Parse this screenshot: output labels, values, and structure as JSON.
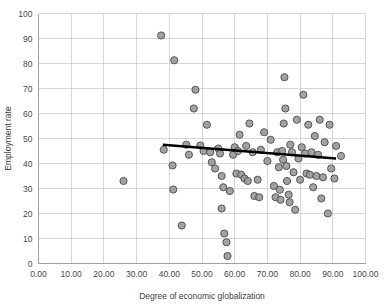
{
  "chart_data": {
    "type": "scatter",
    "title": "",
    "xlabel": "Degree of economic globalization",
    "ylabel": "Employment rate",
    "xlim": [
      0,
      100
    ],
    "ylim": [
      0,
      100
    ],
    "xticks": [
      "0.00",
      "10.00",
      "20.00",
      "30.00",
      "40.00",
      "50.00",
      "60.00",
      "70.00",
      "80.00",
      "90.00",
      "100.00"
    ],
    "xtick_values": [
      0,
      10,
      20,
      30,
      40,
      50,
      60,
      70,
      80,
      90,
      100
    ],
    "yticks": [
      "0",
      "10",
      "20",
      "30",
      "40",
      "50",
      "60",
      "70",
      "80",
      "90",
      "100"
    ],
    "ytick_values": [
      0,
      10,
      20,
      30,
      40,
      50,
      60,
      70,
      80,
      90,
      100
    ],
    "grid": true,
    "legend": false,
    "marker": {
      "shape": "circle",
      "fill_color": "#9a9a9a",
      "edge_color": "#4a4a4a",
      "radius_px": 3.6
    },
    "trendline": {
      "type": "linear",
      "color": "#000000",
      "x_start": 38.0,
      "y_start": 47.5,
      "x_end": 91.0,
      "y_end": 42.0,
      "slope": -0.1038,
      "intercept": 51.44
    },
    "points": [
      {
        "x": 26.0,
        "y": 33.0
      },
      {
        "x": 37.5,
        "y": 91.2
      },
      {
        "x": 38.3,
        "y": 45.5
      },
      {
        "x": 41.5,
        "y": 81.3
      },
      {
        "x": 41.0,
        "y": 39.2
      },
      {
        "x": 41.2,
        "y": 29.6
      },
      {
        "x": 43.8,
        "y": 15.2
      },
      {
        "x": 45.2,
        "y": 47.5
      },
      {
        "x": 46.0,
        "y": 43.5
      },
      {
        "x": 47.5,
        "y": 62.0
      },
      {
        "x": 48.0,
        "y": 69.5
      },
      {
        "x": 49.5,
        "y": 47.2
      },
      {
        "x": 50.5,
        "y": 45.0
      },
      {
        "x": 51.5,
        "y": 55.5
      },
      {
        "x": 52.5,
        "y": 44.5
      },
      {
        "x": 53.0,
        "y": 40.5
      },
      {
        "x": 54.0,
        "y": 38.0
      },
      {
        "x": 55.0,
        "y": 46.0
      },
      {
        "x": 55.5,
        "y": 44.0
      },
      {
        "x": 56.0,
        "y": 35.0
      },
      {
        "x": 56.5,
        "y": 30.5
      },
      {
        "x": 56.0,
        "y": 22.0
      },
      {
        "x": 56.8,
        "y": 12.0
      },
      {
        "x": 57.5,
        "y": 8.5
      },
      {
        "x": 57.8,
        "y": 3.0
      },
      {
        "x": 58.5,
        "y": 29.0
      },
      {
        "x": 59.5,
        "y": 43.5
      },
      {
        "x": 60.0,
        "y": 46.5
      },
      {
        "x": 60.5,
        "y": 36.0
      },
      {
        "x": 61.5,
        "y": 51.5
      },
      {
        "x": 61.0,
        "y": 45.0
      },
      {
        "x": 62.0,
        "y": 35.5
      },
      {
        "x": 63.0,
        "y": 34.0
      },
      {
        "x": 63.5,
        "y": 47.0
      },
      {
        "x": 64.5,
        "y": 56.0
      },
      {
        "x": 64.0,
        "y": 33.0
      },
      {
        "x": 65.5,
        "y": 44.5
      },
      {
        "x": 66.0,
        "y": 27.0
      },
      {
        "x": 67.0,
        "y": 33.5
      },
      {
        "x": 67.5,
        "y": 26.5
      },
      {
        "x": 68.0,
        "y": 45.5
      },
      {
        "x": 69.0,
        "y": 52.5
      },
      {
        "x": 70.0,
        "y": 41.0
      },
      {
        "x": 71.0,
        "y": 49.5
      },
      {
        "x": 72.0,
        "y": 31.0
      },
      {
        "x": 72.5,
        "y": 26.5
      },
      {
        "x": 73.0,
        "y": 44.5
      },
      {
        "x": 73.5,
        "y": 38.5
      },
      {
        "x": 73.8,
        "y": 29.5
      },
      {
        "x": 74.0,
        "y": 25.5
      },
      {
        "x": 74.5,
        "y": 45.0
      },
      {
        "x": 74.8,
        "y": 41.5
      },
      {
        "x": 75.0,
        "y": 56.0
      },
      {
        "x": 75.2,
        "y": 74.5
      },
      {
        "x": 75.5,
        "y": 62.0
      },
      {
        "x": 75.8,
        "y": 39.0
      },
      {
        "x": 76.0,
        "y": 33.0
      },
      {
        "x": 76.5,
        "y": 27.5
      },
      {
        "x": 76.8,
        "y": 24.5
      },
      {
        "x": 77.0,
        "y": 47.5
      },
      {
        "x": 77.5,
        "y": 44.5
      },
      {
        "x": 78.0,
        "y": 36.5
      },
      {
        "x": 78.5,
        "y": 21.5
      },
      {
        "x": 79.0,
        "y": 57.5
      },
      {
        "x": 79.5,
        "y": 42.0
      },
      {
        "x": 80.0,
        "y": 33.5
      },
      {
        "x": 80.5,
        "y": 46.5
      },
      {
        "x": 81.0,
        "y": 67.5
      },
      {
        "x": 81.5,
        "y": 44.0
      },
      {
        "x": 82.0,
        "y": 36.0
      },
      {
        "x": 82.5,
        "y": 55.5
      },
      {
        "x": 83.0,
        "y": 35.5
      },
      {
        "x": 83.5,
        "y": 44.5
      },
      {
        "x": 84.0,
        "y": 30.5
      },
      {
        "x": 84.5,
        "y": 51.0
      },
      {
        "x": 85.0,
        "y": 35.0
      },
      {
        "x": 85.5,
        "y": 43.5
      },
      {
        "x": 86.0,
        "y": 57.5
      },
      {
        "x": 86.5,
        "y": 26.0
      },
      {
        "x": 87.0,
        "y": 34.5
      },
      {
        "x": 87.5,
        "y": 48.5
      },
      {
        "x": 88.5,
        "y": 20.0
      },
      {
        "x": 89.0,
        "y": 55.5
      },
      {
        "x": 89.5,
        "y": 38.0
      },
      {
        "x": 90.5,
        "y": 34.0
      },
      {
        "x": 91.0,
        "y": 47.0
      },
      {
        "x": 92.5,
        "y": 43.0
      }
    ]
  }
}
